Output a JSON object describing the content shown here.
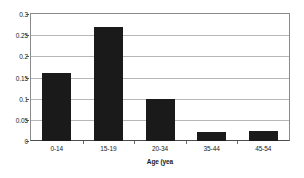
{
  "chart_data": {
    "type": "bar",
    "title": "",
    "xlabel": "Age (yea",
    "ylabel": "",
    "categories": [
      "0-14",
      "15-19",
      "20-34",
      "35-44",
      "45-54"
    ],
    "values": [
      0.16,
      0.27,
      0.1,
      0.022,
      0.024
    ],
    "series": [
      {
        "name": "",
        "values": [
          0.16,
          0.27,
          0.1,
          0.022,
          0.024
        ]
      }
    ],
    "ylim": [
      0,
      0.3
    ],
    "yticks": [
      "0",
      "0.05",
      "0.1",
      "0.15",
      "0.2",
      "0.25",
      "0.3"
    ],
    "ytick_values": [
      0,
      0.05,
      0.1,
      0.15,
      0.2,
      0.25,
      0.3
    ],
    "grid": true,
    "legend": false,
    "legend_position": "none",
    "bar_color": "#1a1a1a",
    "grid_color": "#b6b6b6",
    "axis_color": "#4d4d4d",
    "background_color": "#ffffff"
  }
}
